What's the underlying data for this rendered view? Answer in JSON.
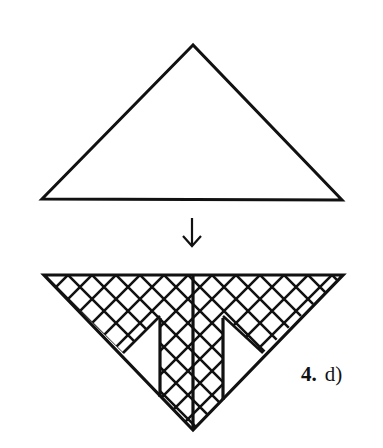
{
  "figure": {
    "label_number": "4.",
    "label_letter": "d)",
    "step_arrow": "down-arrow",
    "top_shape": "plain-triangle",
    "bottom_shape": "inverted-triangle-crosshatched",
    "stroke_color": "#111111",
    "background_color": "#ffffff"
  }
}
